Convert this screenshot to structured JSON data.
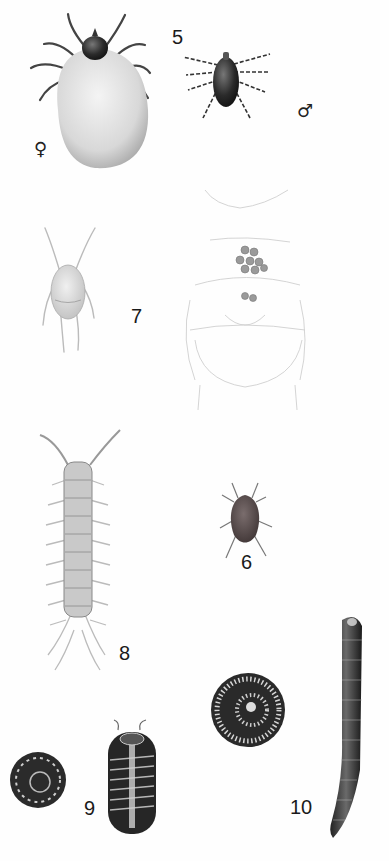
{
  "plate": {
    "background": "#fefefe",
    "figures": [
      {
        "id": "5",
        "label": "5",
        "description": "tick",
        "female_symbol": "♀",
        "male_symbol": "♂"
      },
      {
        "id": "7",
        "label": "7",
        "description": "mite (pale) and faint ventral line drawing with egg cluster"
      },
      {
        "id": "6",
        "label": "6",
        "description": "small reddish-brown mite"
      },
      {
        "id": "8",
        "label": "8",
        "description": "centipede-like arthropod"
      },
      {
        "id": "9",
        "label": "9",
        "description": "pill millipede, curled and extended"
      },
      {
        "id": "10",
        "label": "10",
        "description": "millipede, coiled and extended"
      }
    ]
  },
  "labels": {
    "five": "5",
    "seven": "7",
    "six": "6",
    "eight": "8",
    "nine": "9",
    "ten": "10",
    "female": "♀",
    "male": "♂"
  }
}
